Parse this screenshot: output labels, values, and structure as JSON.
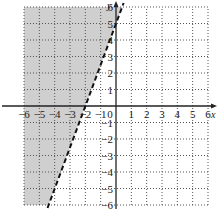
{
  "chart_data": {
    "type": "line",
    "title": "",
    "xlabel": "x",
    "ylabel": "y",
    "xlim": [
      -6,
      6
    ],
    "ylim": [
      -6,
      6
    ],
    "grid": true,
    "grid_style": "dotted",
    "x_ticks": [
      -6,
      -5,
      -4,
      -3,
      -2,
      -1,
      0,
      1,
      2,
      3,
      4,
      5,
      6
    ],
    "y_ticks": [
      -6,
      -5,
      -4,
      -3,
      -2,
      -1,
      1,
      2,
      3,
      4,
      5,
      6
    ],
    "series": [
      {
        "name": "boundary",
        "equation": "y = 2.5x + 5",
        "style": "dashed",
        "points": [
          [
            -4.4,
            -6
          ],
          [
            -2,
            0
          ],
          [
            0,
            5
          ],
          [
            0.4,
            6
          ]
        ]
      }
    ],
    "inequality": "y > 2.5x + 5",
    "shaded_region": "above/left of boundary line",
    "shade_color": "#c8c8c8"
  },
  "colors": {
    "axis": "#222222",
    "grid": "#555555",
    "shade": "#cfcfcf",
    "line": "#111111"
  }
}
